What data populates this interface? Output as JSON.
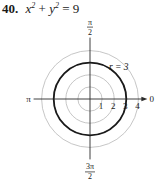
{
  "problem": {
    "number": "40.",
    "equation_html_parts": {
      "x": "x",
      "y": "y",
      "exp": "2",
      "rhs": "= 9"
    }
  },
  "chart_data": {
    "type": "polar",
    "curve": {
      "r": 3,
      "label": "r = 3",
      "color": "#1a1a1a"
    },
    "grid": true,
    "grid_radii": [
      1,
      2,
      3,
      4
    ],
    "grid_color": "#b8b8b8",
    "radial_tick_labels": [
      "1",
      "2",
      "3",
      "4"
    ],
    "angle_labels": {
      "top": {
        "num": "π",
        "den": "2"
      },
      "left": "π",
      "right": "0",
      "bottom": {
        "num": "3π",
        "den": "2"
      }
    },
    "rmax": 4
  }
}
